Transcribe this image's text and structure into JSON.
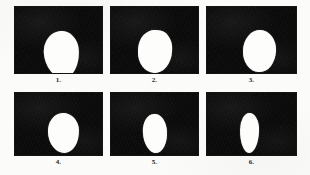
{
  "figure": {
    "kind": "photographic-figure-plate",
    "panel_count": 6,
    "rows": 2,
    "columns": 3,
    "background_color": "#fbfbf9",
    "panel_color": "#0a0a0a",
    "specimen_color": "#fdfdfb"
  },
  "panels": [
    {
      "label": "1.",
      "description": "white ovoid specimen silhouette on black background",
      "panel": {
        "x": 14,
        "y": 6,
        "w": 89,
        "h": 68
      },
      "shape": {
        "cx": 46,
        "cy": 47,
        "rx": 35,
        "ry": 47,
        "rotate": -4,
        "radius": "52% 48% 46% 54% / 44% 42% 58% 56%"
      },
      "label_pos": {
        "y": 76
      }
    },
    {
      "label": "2.",
      "description": "white rounded specimen silhouette with notch on right edge",
      "panel": {
        "x": 110,
        "y": 6,
        "w": 89,
        "h": 68
      },
      "shape": {
        "cx": 44,
        "cy": 44,
        "rx": 34,
        "ry": 43,
        "rotate": 3,
        "radius": "50% 46% 52% 54% / 48% 46% 56% 52%"
      },
      "label_pos": {
        "y": 76
      }
    },
    {
      "label": "3.",
      "description": "white rounded specimen silhouette positioned right of centre",
      "panel": {
        "x": 206,
        "y": 6,
        "w": 91,
        "h": 68
      },
      "shape": {
        "cx": 52,
        "cy": 44,
        "rx": 33,
        "ry": 42,
        "rotate": 2,
        "radius": "52% 50% 48% 50% / 50% 48% 54% 50%"
      },
      "label_pos": {
        "y": 76
      }
    },
    {
      "label": "4.",
      "description": "white rounded specimen silhouette, slightly flattened top",
      "panel": {
        "x": 14,
        "y": 92,
        "w": 89,
        "h": 64
      },
      "shape": {
        "cx": 48,
        "cy": 40,
        "rx": 31,
        "ry": 40,
        "rotate": -2,
        "radius": "50% 50% 48% 52% / 46% 44% 56% 54%"
      },
      "label_pos": {
        "y": 158
      }
    },
    {
      "label": "5.",
      "description": "narrower white ovoid specimen silhouette with small bump on right",
      "panel": {
        "x": 110,
        "y": 92,
        "w": 89,
        "h": 64
      },
      "shape": {
        "cx": 44,
        "cy": 40,
        "rx": 24,
        "ry": 39,
        "rotate": -3,
        "radius": "50% 48% 50% 52% / 46% 46% 54% 54%"
      },
      "label_pos": {
        "y": 158
      }
    },
    {
      "label": "6.",
      "description": "narrowest white vertically elongated specimen silhouette",
      "panel": {
        "x": 206,
        "y": 92,
        "w": 91,
        "h": 64
      },
      "shape": {
        "cx": 42,
        "cy": 40,
        "rx": 19,
        "ry": 40,
        "rotate": 1,
        "radius": "48% 52% 50% 50% / 42% 42% 58% 58%"
      },
      "label_pos": {
        "y": 158
      }
    }
  ]
}
